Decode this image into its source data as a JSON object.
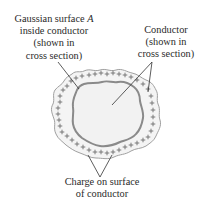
{
  "diagram": {
    "labels": {
      "gaussian": {
        "line1_text": "Gaussian surface ",
        "line1_italic": "A",
        "line2": "inside conductor",
        "line3": "(shown in",
        "line4": "cross section)"
      },
      "conductor": {
        "line1": "Conductor",
        "line2": "(shown in",
        "line3": "cross section)"
      },
      "charge": {
        "line1": "Charge on surface",
        "line2": "of conductor"
      }
    },
    "charge_symbol": "+",
    "colors": {
      "conductor_fill": "#f4f4f4",
      "conductor_outline": "#9a9a9a",
      "gaussian_surface": "#8a8a8a",
      "charge_symbols": "#6e6e6e",
      "leader_lines": "#333333",
      "text": "#2a2a2a"
    }
  }
}
